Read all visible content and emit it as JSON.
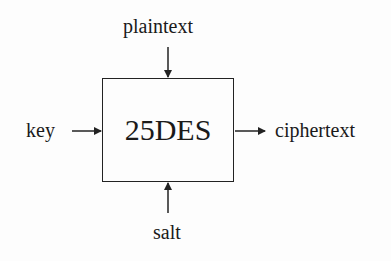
{
  "diagram": {
    "block": {
      "label": "25DES"
    },
    "inputs": [
      {
        "label": "plaintext",
        "direction": "top"
      },
      {
        "label": "key",
        "direction": "left"
      },
      {
        "label": "salt",
        "direction": "bottom"
      }
    ],
    "outputs": [
      {
        "label": "ciphertext",
        "direction": "right"
      }
    ],
    "colors": {
      "stroke": "#222222",
      "background": "#fdfdfd"
    }
  }
}
